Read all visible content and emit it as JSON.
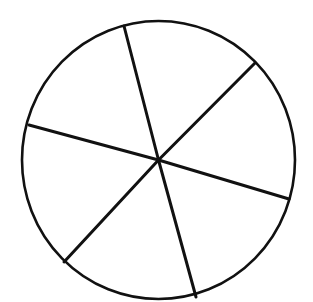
{
  "diagram": {
    "type": "circle-divided-into-sectors",
    "sector_count": 6,
    "labels": [],
    "stroke_color": "#111111",
    "fill_color": "#ffffff",
    "circle": {
      "cx": 158.5,
      "cy": 160,
      "rx": 136.5,
      "ry": 139
    },
    "spokes": [
      {
        "x": 124,
        "y": 26
      },
      {
        "x": 255,
        "y": 63
      },
      {
        "x": 289,
        "y": 199
      },
      {
        "x": 196,
        "y": 297
      },
      {
        "x": 64,
        "y": 262
      },
      {
        "x": 29,
        "y": 125
      }
    ]
  }
}
